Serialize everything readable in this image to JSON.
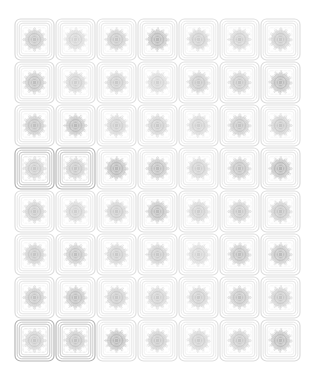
{
  "sheet": {
    "title": "Guilloche Security Pattern Sheet",
    "background_color": "#ffffff",
    "width": 316,
    "height": 379,
    "grid": {
      "columns": 7,
      "rows": 8,
      "cell_count": 56,
      "cell_width": 41,
      "cell_height": 43,
      "origin_x": 14,
      "origin_y": 18
    },
    "ink_colors": {
      "frame_light": "#ededed",
      "frame_mid": "#e0e0e0",
      "frame_dark": "#c9c9c9",
      "rosette_light": "#d8d8d8",
      "rosette_mid": "#bdbdbd",
      "rosette_dark": "#9a9a9a"
    },
    "motif": {
      "name": "rosette-guilloche",
      "frame_shape": "rounded-square",
      "nested_frame_count": 4,
      "rosette_spokes": 72,
      "rosette_rings": 3
    }
  },
  "tiles": [
    {
      "id": "tile-r1c1",
      "row": 1,
      "col": 1,
      "ink": 0.52,
      "frame": 0.3,
      "spokes": 72,
      "rot": 0
    },
    {
      "id": "tile-r1c2",
      "row": 1,
      "col": 2,
      "ink": 0.38,
      "frame": 0.26,
      "spokes": 68,
      "rot": 3
    },
    {
      "id": "tile-r1c3",
      "row": 1,
      "col": 3,
      "ink": 0.5,
      "frame": 0.24,
      "spokes": 74,
      "rot": 1
    },
    {
      "id": "tile-r1c4",
      "row": 1,
      "col": 4,
      "ink": 0.62,
      "frame": 0.26,
      "spokes": 70,
      "rot": 2
    },
    {
      "id": "tile-r1c5",
      "row": 1,
      "col": 5,
      "ink": 0.44,
      "frame": 0.24,
      "spokes": 72,
      "rot": 4
    },
    {
      "id": "tile-r1c6",
      "row": 1,
      "col": 6,
      "ink": 0.46,
      "frame": 0.24,
      "spokes": 66,
      "rot": 0
    },
    {
      "id": "tile-r1c7",
      "row": 1,
      "col": 7,
      "ink": 0.48,
      "frame": 0.26,
      "spokes": 72,
      "rot": 2
    },
    {
      "id": "tile-r2c1",
      "row": 2,
      "col": 1,
      "ink": 0.56,
      "frame": 0.28,
      "spokes": 72,
      "rot": 1
    },
    {
      "id": "tile-r2c2",
      "row": 2,
      "col": 2,
      "ink": 0.42,
      "frame": 0.24,
      "spokes": 70,
      "rot": 3
    },
    {
      "id": "tile-r2c3",
      "row": 2,
      "col": 3,
      "ink": 0.46,
      "frame": 0.24,
      "spokes": 72,
      "rot": 0
    },
    {
      "id": "tile-r2c4",
      "row": 2,
      "col": 4,
      "ink": 0.4,
      "frame": 0.24,
      "spokes": 68,
      "rot": 2
    },
    {
      "id": "tile-r2c5",
      "row": 2,
      "col": 5,
      "ink": 0.48,
      "frame": 0.24,
      "spokes": 74,
      "rot": 4
    },
    {
      "id": "tile-r2c6",
      "row": 2,
      "col": 6,
      "ink": 0.5,
      "frame": 0.26,
      "spokes": 72,
      "rot": 1
    },
    {
      "id": "tile-r2c7",
      "row": 2,
      "col": 7,
      "ink": 0.6,
      "frame": 0.28,
      "spokes": 70,
      "rot": 3
    },
    {
      "id": "tile-r3c1",
      "row": 3,
      "col": 1,
      "ink": 0.54,
      "frame": 0.28,
      "spokes": 72,
      "rot": 2
    },
    {
      "id": "tile-r3c2",
      "row": 3,
      "col": 2,
      "ink": 0.6,
      "frame": 0.26,
      "spokes": 74,
      "rot": 0
    },
    {
      "id": "tile-r3c3",
      "row": 3,
      "col": 3,
      "ink": 0.44,
      "frame": 0.24,
      "spokes": 70,
      "rot": 3
    },
    {
      "id": "tile-r3c4",
      "row": 3,
      "col": 4,
      "ink": 0.46,
      "frame": 0.24,
      "spokes": 72,
      "rot": 1
    },
    {
      "id": "tile-r3c5",
      "row": 3,
      "col": 5,
      "ink": 0.42,
      "frame": 0.24,
      "spokes": 68,
      "rot": 4
    },
    {
      "id": "tile-r3c6",
      "row": 3,
      "col": 6,
      "ink": 0.52,
      "frame": 0.26,
      "spokes": 72,
      "rot": 2
    },
    {
      "id": "tile-r3c7",
      "row": 3,
      "col": 7,
      "ink": 0.5,
      "frame": 0.24,
      "spokes": 70,
      "rot": 0
    },
    {
      "id": "tile-r4c1",
      "row": 4,
      "col": 1,
      "ink": 0.46,
      "frame": 0.62,
      "spokes": 72,
      "rot": 1
    },
    {
      "id": "tile-r4c2",
      "row": 4,
      "col": 2,
      "ink": 0.5,
      "frame": 0.58,
      "spokes": 70,
      "rot": 3
    },
    {
      "id": "tile-r4c3",
      "row": 4,
      "col": 3,
      "ink": 0.62,
      "frame": 0.26,
      "spokes": 74,
      "rot": 2
    },
    {
      "id": "tile-r4c4",
      "row": 4,
      "col": 4,
      "ink": 0.58,
      "frame": 0.24,
      "spokes": 72,
      "rot": 0
    },
    {
      "id": "tile-r4c5",
      "row": 4,
      "col": 5,
      "ink": 0.44,
      "frame": 0.24,
      "spokes": 68,
      "rot": 4
    },
    {
      "id": "tile-r4c6",
      "row": 4,
      "col": 6,
      "ink": 0.54,
      "frame": 0.26,
      "spokes": 72,
      "rot": 2
    },
    {
      "id": "tile-r4c7",
      "row": 4,
      "col": 7,
      "ink": 0.64,
      "frame": 0.28,
      "spokes": 70,
      "rot": 1
    },
    {
      "id": "tile-r5c1",
      "row": 5,
      "col": 1,
      "ink": 0.48,
      "frame": 0.26,
      "spokes": 72,
      "rot": 0
    },
    {
      "id": "tile-r5c2",
      "row": 5,
      "col": 2,
      "ink": 0.42,
      "frame": 0.24,
      "spokes": 70,
      "rot": 2
    },
    {
      "id": "tile-r5c3",
      "row": 5,
      "col": 3,
      "ink": 0.46,
      "frame": 0.24,
      "spokes": 72,
      "rot": 4
    },
    {
      "id": "tile-r5c4",
      "row": 5,
      "col": 4,
      "ink": 0.58,
      "frame": 0.26,
      "spokes": 74,
      "rot": 1
    },
    {
      "id": "tile-r5c5",
      "row": 5,
      "col": 5,
      "ink": 0.44,
      "frame": 0.24,
      "spokes": 68,
      "rot": 3
    },
    {
      "id": "tile-r5c6",
      "row": 5,
      "col": 6,
      "ink": 0.5,
      "frame": 0.24,
      "spokes": 72,
      "rot": 0
    },
    {
      "id": "tile-r5c7",
      "row": 5,
      "col": 7,
      "ink": 0.52,
      "frame": 0.26,
      "spokes": 70,
      "rot": 2
    },
    {
      "id": "tile-r6c1",
      "row": 6,
      "col": 1,
      "ink": 0.5,
      "frame": 0.26,
      "spokes": 72,
      "rot": 3
    },
    {
      "id": "tile-r6c2",
      "row": 6,
      "col": 2,
      "ink": 0.54,
      "frame": 0.26,
      "spokes": 72,
      "rot": 1
    },
    {
      "id": "tile-r6c3",
      "row": 6,
      "col": 3,
      "ink": 0.46,
      "frame": 0.24,
      "spokes": 70,
      "rot": 4
    },
    {
      "id": "tile-r6c4",
      "row": 6,
      "col": 4,
      "ink": 0.48,
      "frame": 0.24,
      "spokes": 74,
      "rot": 0
    },
    {
      "id": "tile-r6c5",
      "row": 6,
      "col": 5,
      "ink": 0.4,
      "frame": 0.24,
      "spokes": 68,
      "rot": 2
    },
    {
      "id": "tile-r6c6",
      "row": 6,
      "col": 6,
      "ink": 0.56,
      "frame": 0.26,
      "spokes": 72,
      "rot": 3
    },
    {
      "id": "tile-r6c7",
      "row": 6,
      "col": 7,
      "ink": 0.58,
      "frame": 0.26,
      "spokes": 70,
      "rot": 1
    },
    {
      "id": "tile-r7c1",
      "row": 7,
      "col": 1,
      "ink": 0.52,
      "frame": 0.28,
      "spokes": 72,
      "rot": 0
    },
    {
      "id": "tile-r7c2",
      "row": 7,
      "col": 2,
      "ink": 0.56,
      "frame": 0.26,
      "spokes": 74,
      "rot": 2
    },
    {
      "id": "tile-r7c3",
      "row": 7,
      "col": 3,
      "ink": 0.48,
      "frame": 0.24,
      "spokes": 70,
      "rot": 4
    },
    {
      "id": "tile-r7c4",
      "row": 7,
      "col": 4,
      "ink": 0.44,
      "frame": 0.24,
      "spokes": 72,
      "rot": 1
    },
    {
      "id": "tile-r7c5",
      "row": 7,
      "col": 5,
      "ink": 0.46,
      "frame": 0.24,
      "spokes": 68,
      "rot": 3
    },
    {
      "id": "tile-r7c6",
      "row": 7,
      "col": 6,
      "ink": 0.54,
      "frame": 0.26,
      "spokes": 72,
      "rot": 0
    },
    {
      "id": "tile-r7c7",
      "row": 7,
      "col": 7,
      "ink": 0.5,
      "frame": 0.26,
      "spokes": 70,
      "rot": 2
    },
    {
      "id": "tile-r8c1",
      "row": 8,
      "col": 1,
      "ink": 0.46,
      "frame": 0.6,
      "spokes": 72,
      "rot": 1
    },
    {
      "id": "tile-r8c2",
      "row": 8,
      "col": 2,
      "ink": 0.52,
      "frame": 0.58,
      "spokes": 70,
      "rot": 3
    },
    {
      "id": "tile-r8c3",
      "row": 8,
      "col": 3,
      "ink": 0.62,
      "frame": 0.26,
      "spokes": 74,
      "rot": 0
    },
    {
      "id": "tile-r8c4",
      "row": 8,
      "col": 4,
      "ink": 0.48,
      "frame": 0.24,
      "spokes": 72,
      "rot": 2
    },
    {
      "id": "tile-r8c5",
      "row": 8,
      "col": 5,
      "ink": 0.44,
      "frame": 0.24,
      "spokes": 68,
      "rot": 4
    },
    {
      "id": "tile-r8c6",
      "row": 8,
      "col": 6,
      "ink": 0.5,
      "frame": 0.26,
      "spokes": 72,
      "rot": 1
    },
    {
      "id": "tile-r8c7",
      "row": 8,
      "col": 7,
      "ink": 0.6,
      "frame": 0.28,
      "spokes": 70,
      "rot": 3
    }
  ]
}
